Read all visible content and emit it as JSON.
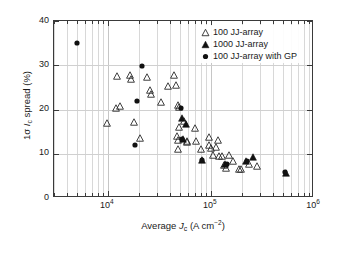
{
  "chart_data": {
    "type": "scatter",
    "title": "",
    "xlabel": "Average Jc (A cm-2)",
    "ylabel": "1σ Ic spread (%)",
    "xscale": "log",
    "yscale": "linear",
    "xlim": [
      3000,
      1000000
    ],
    "ylim": [
      0,
      40
    ],
    "grid": "both",
    "legend_position": "top-right",
    "xticks": [
      {
        "value": 10000,
        "label": "10",
        "exponent": "4"
      },
      {
        "value": 100000,
        "label": "10",
        "exponent": "5"
      },
      {
        "value": 1000000,
        "label": "10",
        "exponent": "6"
      }
    ],
    "yticks": [
      0,
      10,
      20,
      30,
      40
    ],
    "series": [
      {
        "name": "100 JJ-array",
        "marker": "open-triangle",
        "color": "#1a1a1a",
        "points": [
          [
            9900,
            17.0
          ],
          [
            12200,
            27.6
          ],
          [
            12100,
            20.4
          ],
          [
            13000,
            20.9
          ],
          [
            16500,
            27.9
          ],
          [
            16800,
            26.8
          ],
          [
            17800,
            17.1
          ],
          [
            20500,
            13.5
          ],
          [
            23800,
            27.4
          ],
          [
            25800,
            24.4
          ],
          [
            26000,
            23.5
          ],
          [
            33000,
            21.8
          ],
          [
            38500,
            25.4
          ],
          [
            44000,
            27.8
          ],
          [
            46000,
            25.6
          ],
          [
            48000,
            21.0
          ],
          [
            49000,
            20.6
          ],
          [
            48500,
            16.0
          ],
          [
            47000,
            14.0
          ],
          [
            47500,
            13.2
          ],
          [
            48000,
            11.0
          ],
          [
            55000,
            17.3
          ],
          [
            58000,
            13.0
          ],
          [
            59000,
            12.6
          ],
          [
            70000,
            15.8
          ],
          [
            72000,
            13.0
          ],
          [
            80000,
            11.0
          ],
          [
            95000,
            13.8
          ],
          [
            96000,
            12.0
          ],
          [
            99000,
            11.4
          ],
          [
            105000,
            9.8
          ],
          [
            112000,
            11.6
          ],
          [
            118000,
            13.2
          ],
          [
            120000,
            9.4
          ],
          [
            128000,
            9.6
          ],
          [
            135000,
            7.4
          ],
          [
            140000,
            6.8
          ],
          [
            150000,
            9.7
          ],
          [
            162000,
            8.4
          ],
          [
            185000,
            6.6
          ],
          [
            195000,
            6.5
          ],
          [
            235000,
            7.8
          ],
          [
            280000,
            7.2
          ]
        ]
      },
      {
        "name": "1000 JJ-array",
        "marker": "filled-triangle",
        "color": "#111111",
        "points": [
          [
            52000,
            18.0
          ],
          [
            57000,
            16.8
          ],
          [
            53000,
            13.3
          ],
          [
            81000,
            8.6
          ],
          [
            138000,
            7.8
          ],
          [
            218000,
            8.4
          ],
          [
            258000,
            9.3
          ],
          [
            530000,
            5.6
          ]
        ]
      },
      {
        "name": "100 JJ-array with GP",
        "marker": "filled-circle",
        "color": "#111111",
        "points": [
          [
            5000,
            35.0
          ],
          [
            18500,
            12.0
          ],
          [
            19000,
            21.9
          ],
          [
            21500,
            29.9
          ],
          [
            51000,
            20.4
          ],
          [
            52500,
            13.3
          ],
          [
            82000,
            8.5
          ],
          [
            142000,
            7.8
          ],
          [
            225000,
            8.4
          ],
          [
            525000,
            5.8
          ]
        ]
      }
    ]
  },
  "legend": {
    "items": [
      {
        "label": "100 JJ-array",
        "marker": "open-triangle"
      },
      {
        "label": "1000 JJ-array",
        "marker": "filled-triangle"
      },
      {
        "label": "100 JJ-array with GP",
        "marker": "filled-circle"
      }
    ]
  },
  "axes": {
    "x_title_prefix": "Average ",
    "x_title_var": "J",
    "x_title_sub": "c",
    "x_title_units_open": " (A cm",
    "x_title_units_exp": "−2",
    "x_title_units_close": ")",
    "y_title_sigma": "1σ ",
    "y_title_var": "I",
    "y_title_sub": "c",
    "y_title_rest": " spread (%)"
  }
}
